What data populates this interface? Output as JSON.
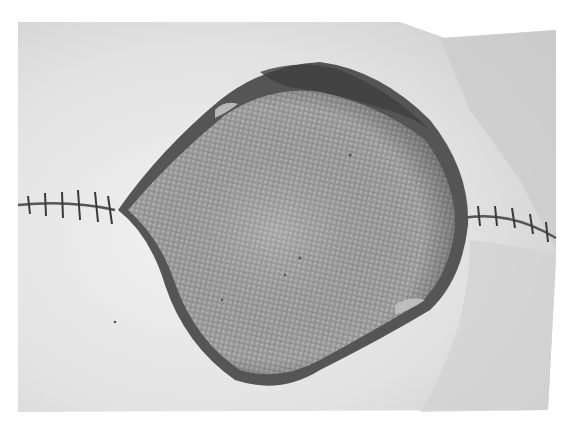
{
  "image": {
    "kind": "grayscale clinical photograph",
    "subject": "open wound with exposed mesh, flanked by sutured incision lines",
    "colors": {
      "background": "#ffffff",
      "skin_light": "#e6e6e6",
      "skin_mid": "#cfcfcf",
      "mesh": "#9a9a9a",
      "wound_edge": "#4a4a4a",
      "suture": "#3a3a3a"
    }
  }
}
